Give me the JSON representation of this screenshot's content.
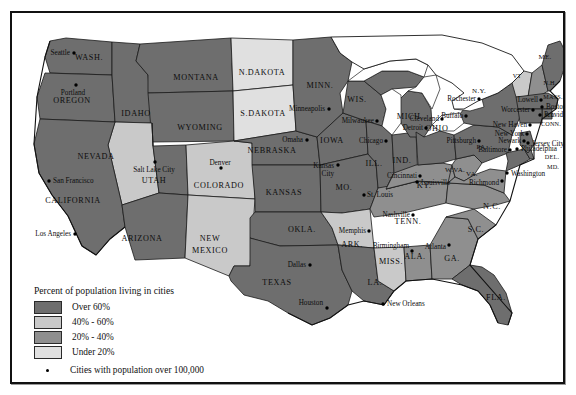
{
  "map": {
    "title": "Percent of population living in cities",
    "colors": {
      "over60": "#6e6e6e",
      "p40_60": "#c9c9c9",
      "p20_40": "#8f8f8f",
      "under20": "#e0e0e0",
      "water": "#ffffff",
      "border": "#1a1a1a"
    },
    "legend": {
      "title": "Percent of population living in cities",
      "items": [
        {
          "label": "Over 60%",
          "color": "#6e6e6e"
        },
        {
          "label": "40% - 60%",
          "color": "#c9c9c9"
        },
        {
          "label": "20% - 40%",
          "color": "#8f8f8f"
        },
        {
          "label": "Under 20%",
          "color": "#e0e0e0"
        }
      ],
      "cities_note": "Cities with population over 100,000"
    },
    "states": [
      {
        "name": "WASH.",
        "x": 77,
        "y": 47,
        "cls": "state"
      },
      {
        "name": "OREGON",
        "x": 60,
        "y": 90,
        "cls": "state"
      },
      {
        "name": "IDAHO",
        "x": 124,
        "y": 103,
        "cls": "state"
      },
      {
        "name": "MONTANA",
        "x": 184,
        "y": 67,
        "cls": "state"
      },
      {
        "name": "WYOMING",
        "x": 188,
        "y": 117,
        "cls": "state"
      },
      {
        "name": "NEVADA",
        "x": 84,
        "y": 146,
        "cls": "state"
      },
      {
        "name": "CALIFORNIA",
        "x": 61,
        "y": 190,
        "cls": "state"
      },
      {
        "name": "UTAH",
        "x": 142,
        "y": 170,
        "cls": "state"
      },
      {
        "name": "ARIZONA",
        "x": 130,
        "y": 228,
        "cls": "state"
      },
      {
        "name": "COLORADO",
        "x": 207,
        "y": 175,
        "cls": "state"
      },
      {
        "name": "NEW",
        "x": 198,
        "y": 228,
        "cls": "state"
      },
      {
        "name": "MEXICO",
        "x": 198,
        "y": 240,
        "cls": "state"
      },
      {
        "name": "N.DAKOTA",
        "x": 250,
        "y": 62,
        "cls": "state"
      },
      {
        "name": "S.DAKOTA",
        "x": 251,
        "y": 103,
        "cls": "state"
      },
      {
        "name": "NEBRASKA",
        "x": 260,
        "y": 140,
        "cls": "state"
      },
      {
        "name": "KANSAS",
        "x": 272,
        "y": 182,
        "cls": "state"
      },
      {
        "name": "OKLA.",
        "x": 290,
        "y": 219,
        "cls": "state"
      },
      {
        "name": "TEXAS",
        "x": 265,
        "y": 272,
        "cls": "state"
      },
      {
        "name": "MINN.",
        "x": 308,
        "y": 75,
        "cls": "state"
      },
      {
        "name": "IOWA",
        "x": 320,
        "y": 130,
        "cls": "state"
      },
      {
        "name": "MO.",
        "x": 332,
        "y": 177,
        "cls": "state"
      },
      {
        "name": "ARK.",
        "x": 340,
        "y": 234,
        "cls": "state"
      },
      {
        "name": "LA.",
        "x": 363,
        "y": 272,
        "cls": "state"
      },
      {
        "name": "WIS.",
        "x": 345,
        "y": 89,
        "cls": "state"
      },
      {
        "name": "ILL.",
        "x": 362,
        "y": 153,
        "cls": "state"
      },
      {
        "name": "MISS.",
        "x": 379,
        "y": 251,
        "cls": "state"
      },
      {
        "name": "IND.",
        "x": 390,
        "y": 150,
        "cls": "state"
      },
      {
        "name": "MICH.",
        "x": 398,
        "y": 106,
        "cls": "state"
      },
      {
        "name": "ALA.",
        "x": 403,
        "y": 246,
        "cls": "state"
      },
      {
        "name": "TENN.",
        "x": 396,
        "y": 211,
        "cls": "state"
      },
      {
        "name": "KY.",
        "x": 412,
        "y": 175,
        "cls": "state"
      },
      {
        "name": "OHIO",
        "x": 425,
        "y": 118,
        "cls": "state"
      },
      {
        "name": "GA.",
        "x": 440,
        "y": 248,
        "cls": "state"
      },
      {
        "name": "S.C.",
        "x": 464,
        "y": 219,
        "cls": "state"
      },
      {
        "name": "N.C.",
        "x": 480,
        "y": 196,
        "cls": "state"
      },
      {
        "name": "FLA.",
        "x": 484,
        "y": 287,
        "cls": "state"
      },
      {
        "name": "W.VA.",
        "x": 443,
        "y": 159,
        "cls": "state sm"
      },
      {
        "name": "VA.",
        "x": 460,
        "y": 163,
        "cls": "state sm"
      },
      {
        "name": "PA.",
        "x": 470,
        "y": 136,
        "cls": "state sm"
      },
      {
        "name": "N.Y.",
        "x": 467,
        "y": 80,
        "cls": "state sm"
      },
      {
        "name": "VT",
        "x": 505,
        "y": 65,
        "cls": "state xs"
      },
      {
        "name": "N.H.",
        "x": 538,
        "y": 72,
        "cls": "state xs"
      },
      {
        "name": "ME.",
        "x": 533,
        "y": 46,
        "cls": "state sm"
      },
      {
        "name": "MASS.",
        "x": 541,
        "y": 86,
        "cls": "state xs"
      },
      {
        "name": "R.I.",
        "x": 538,
        "y": 104,
        "cls": "state xs"
      },
      {
        "name": "CONN.",
        "x": 539,
        "y": 113,
        "cls": "state xs"
      },
      {
        "name": "DEL.",
        "x": 540,
        "y": 146,
        "cls": "state xs"
      },
      {
        "name": "MD.",
        "x": 541,
        "y": 156,
        "cls": "state xs"
      }
    ],
    "cities": [
      {
        "name": "Seattle",
        "dx": 62,
        "dy": 40,
        "lx": 58,
        "ly": 42,
        "align": "city"
      },
      {
        "name": "Portland",
        "dx": 64,
        "dy": 72,
        "lx": 61,
        "ly": 82,
        "align": "city c"
      },
      {
        "name": "San Francisco",
        "dx": 37,
        "dy": 168,
        "lx": 41,
        "ly": 170,
        "align": "city l"
      },
      {
        "name": "Los Angeles",
        "dx": 63,
        "dy": 221,
        "lx": 59,
        "ly": 223,
        "align": "city"
      },
      {
        "name": "Salt Lake City",
        "dx": 143,
        "dy": 149,
        "lx": 142,
        "ly": 159,
        "align": "city c"
      },
      {
        "name": "Denver",
        "dx": 209,
        "dy": 155,
        "lx": 208,
        "ly": 152,
        "align": "city c"
      },
      {
        "name": "Minneapolis",
        "dx": 317,
        "dy": 96,
        "lx": 313,
        "ly": 98,
        "align": "city"
      },
      {
        "name": "Omaha",
        "dx": 295,
        "dy": 127,
        "lx": 291,
        "ly": 129,
        "align": "city"
      },
      {
        "name": "Kansas",
        "dx": 326,
        "dy": 152,
        "lx": 322,
        "ly": 155,
        "align": "city"
      },
      {
        "name": "City",
        "dx": -1,
        "dy": -1,
        "lx": 322,
        "ly": 163,
        "align": "city"
      },
      {
        "name": "Milwaukee",
        "dx": 365,
        "dy": 108,
        "lx": 362,
        "ly": 110,
        "align": "city"
      },
      {
        "name": "Chicago",
        "dx": 374,
        "dy": 128,
        "lx": 371,
        "ly": 130,
        "align": "city"
      },
      {
        "name": "St. Louis",
        "dx": 352,
        "dy": 182,
        "lx": 355,
        "ly": 184,
        "align": "city l"
      },
      {
        "name": "Detroit",
        "dx": 414,
        "dy": 115,
        "lx": 411,
        "ly": 117,
        "align": "city"
      },
      {
        "name": "Cleveland",
        "dx": 430,
        "dy": 106,
        "lx": 427,
        "ly": 108,
        "align": "city"
      },
      {
        "name": "Cincinnati",
        "dx": 408,
        "dy": 163,
        "lx": 405,
        "ly": 165,
        "align": "city"
      },
      {
        "name": "Louisville",
        "dx": 405,
        "dy": 169,
        "lx": 409,
        "ly": 172,
        "align": "city l"
      },
      {
        "name": "Buffalo",
        "dx": 454,
        "dy": 103,
        "lx": 451,
        "ly": 105,
        "align": "city"
      },
      {
        "name": "Rochester",
        "dx": 467,
        "dy": 86,
        "lx": 464,
        "ly": 88,
        "align": "city"
      },
      {
        "name": "Pittsburgh",
        "dx": 467,
        "dy": 128,
        "lx": 464,
        "ly": 130,
        "align": "city"
      },
      {
        "name": "Baltimore",
        "dx": 498,
        "dy": 137,
        "lx": 495,
        "ly": 139,
        "align": "city"
      },
      {
        "name": "Philadelphia",
        "dx": 505,
        "dy": 136,
        "lx": 509,
        "ly": 138,
        "align": "city l"
      },
      {
        "name": "Washington",
        "dx": 495,
        "dy": 160,
        "lx": 499,
        "ly": 163,
        "align": "city l"
      },
      {
        "name": "Richmond",
        "dx": 490,
        "dy": 168,
        "lx": 487,
        "ly": 172,
        "align": "city"
      },
      {
        "name": "New York",
        "dx": 515,
        "dy": 121,
        "lx": 512,
        "ly": 123,
        "align": "city"
      },
      {
        "name": "Newark",
        "dx": 512,
        "dy": 128,
        "lx": 509,
        "ly": 130,
        "align": "city"
      },
      {
        "name": "Jersey City",
        "dx": 516,
        "dy": 130,
        "lx": 520,
        "ly": 133,
        "align": "city l"
      },
      {
        "name": "New Haven",
        "dx": 518,
        "dy": 112,
        "lx": 515,
        "ly": 114,
        "align": "city"
      },
      {
        "name": "Providence",
        "dx": 528,
        "dy": 102,
        "lx": 532,
        "ly": 104,
        "align": "city l"
      },
      {
        "name": "Boston",
        "dx": 530,
        "dy": 94,
        "lx": 534,
        "ly": 96,
        "align": "city l"
      },
      {
        "name": "Worcester",
        "dx": 521,
        "dy": 97,
        "lx": 518,
        "ly": 99,
        "align": "city"
      },
      {
        "name": "Lowell",
        "dx": 529,
        "dy": 87,
        "lx": 526,
        "ly": 89,
        "align": "city"
      },
      {
        "name": "Memphis",
        "dx": 357,
        "dy": 218,
        "lx": 354,
        "ly": 220,
        "align": "city"
      },
      {
        "name": "Nashville",
        "dx": 401,
        "dy": 202,
        "lx": 398,
        "ly": 204,
        "align": "city"
      },
      {
        "name": "Birmingham",
        "dx": 400,
        "dy": 238,
        "lx": 397,
        "ly": 235,
        "align": "city"
      },
      {
        "name": "Atlanta",
        "dx": 437,
        "dy": 232,
        "lx": 434,
        "ly": 236,
        "align": "city"
      },
      {
        "name": "Dallas",
        "dx": 298,
        "dy": 252,
        "lx": 294,
        "ly": 254,
        "align": "city"
      },
      {
        "name": "Houston",
        "dx": 315,
        "dy": 295,
        "lx": 311,
        "ly": 292,
        "align": "city"
      },
      {
        "name": "New Orleans",
        "dx": 371,
        "dy": 291,
        "lx": 375,
        "ly": 293,
        "align": "city l"
      }
    ]
  }
}
